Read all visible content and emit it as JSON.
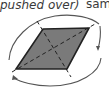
{
  "labels": {
    "left": "pushed over)",
    "right": "sam"
  },
  "shape": {
    "type": "parallelogram",
    "fill": "#7a7a7a",
    "stroke": "#222222",
    "vertices": [
      [
        43,
        29
      ],
      [
        89,
        28
      ],
      [
        67,
        69
      ],
      [
        16,
        69
      ]
    ],
    "diagonals": "dashed",
    "center": [
      53,
      48
    ]
  },
  "rotation_arrows": {
    "stroke": "#555555",
    "count": 2,
    "direction": "clockwise"
  }
}
